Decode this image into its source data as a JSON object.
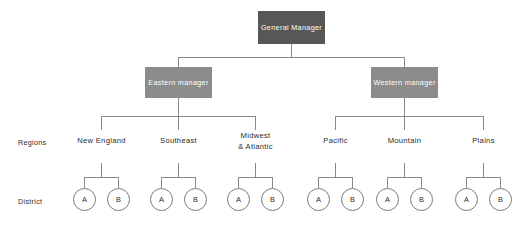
{
  "diagram": {
    "title_node": {
      "label": "General Manager"
    },
    "managers": [
      {
        "label": "Eastern manager"
      },
      {
        "label": "Western manager"
      }
    ],
    "row_labels": {
      "regions": "Regions",
      "district": "District"
    },
    "regions": [
      {
        "label": "New England",
        "districts": [
          "A",
          "B"
        ]
      },
      {
        "label": "Southeast",
        "districts": [
          "A",
          "B"
        ]
      },
      {
        "label": "Midwest\n& Atlantic",
        "districts": [
          "A",
          "B"
        ]
      },
      {
        "label": "Pacific",
        "districts": [
          "A",
          "B"
        ]
      },
      {
        "label": "Mountain",
        "districts": [
          "A",
          "B"
        ]
      },
      {
        "label": "Plains",
        "districts": [
          "A",
          "B"
        ]
      }
    ],
    "colors": {
      "general_manager_box": "#575757",
      "manager_box": "#8c8c8c",
      "connector_line": "#8a8a8a",
      "circle_stroke": "#7a7a7a",
      "text_dark": "#2b2b2b",
      "text_light": "#ffffff",
      "background": "#ffffff"
    }
  }
}
